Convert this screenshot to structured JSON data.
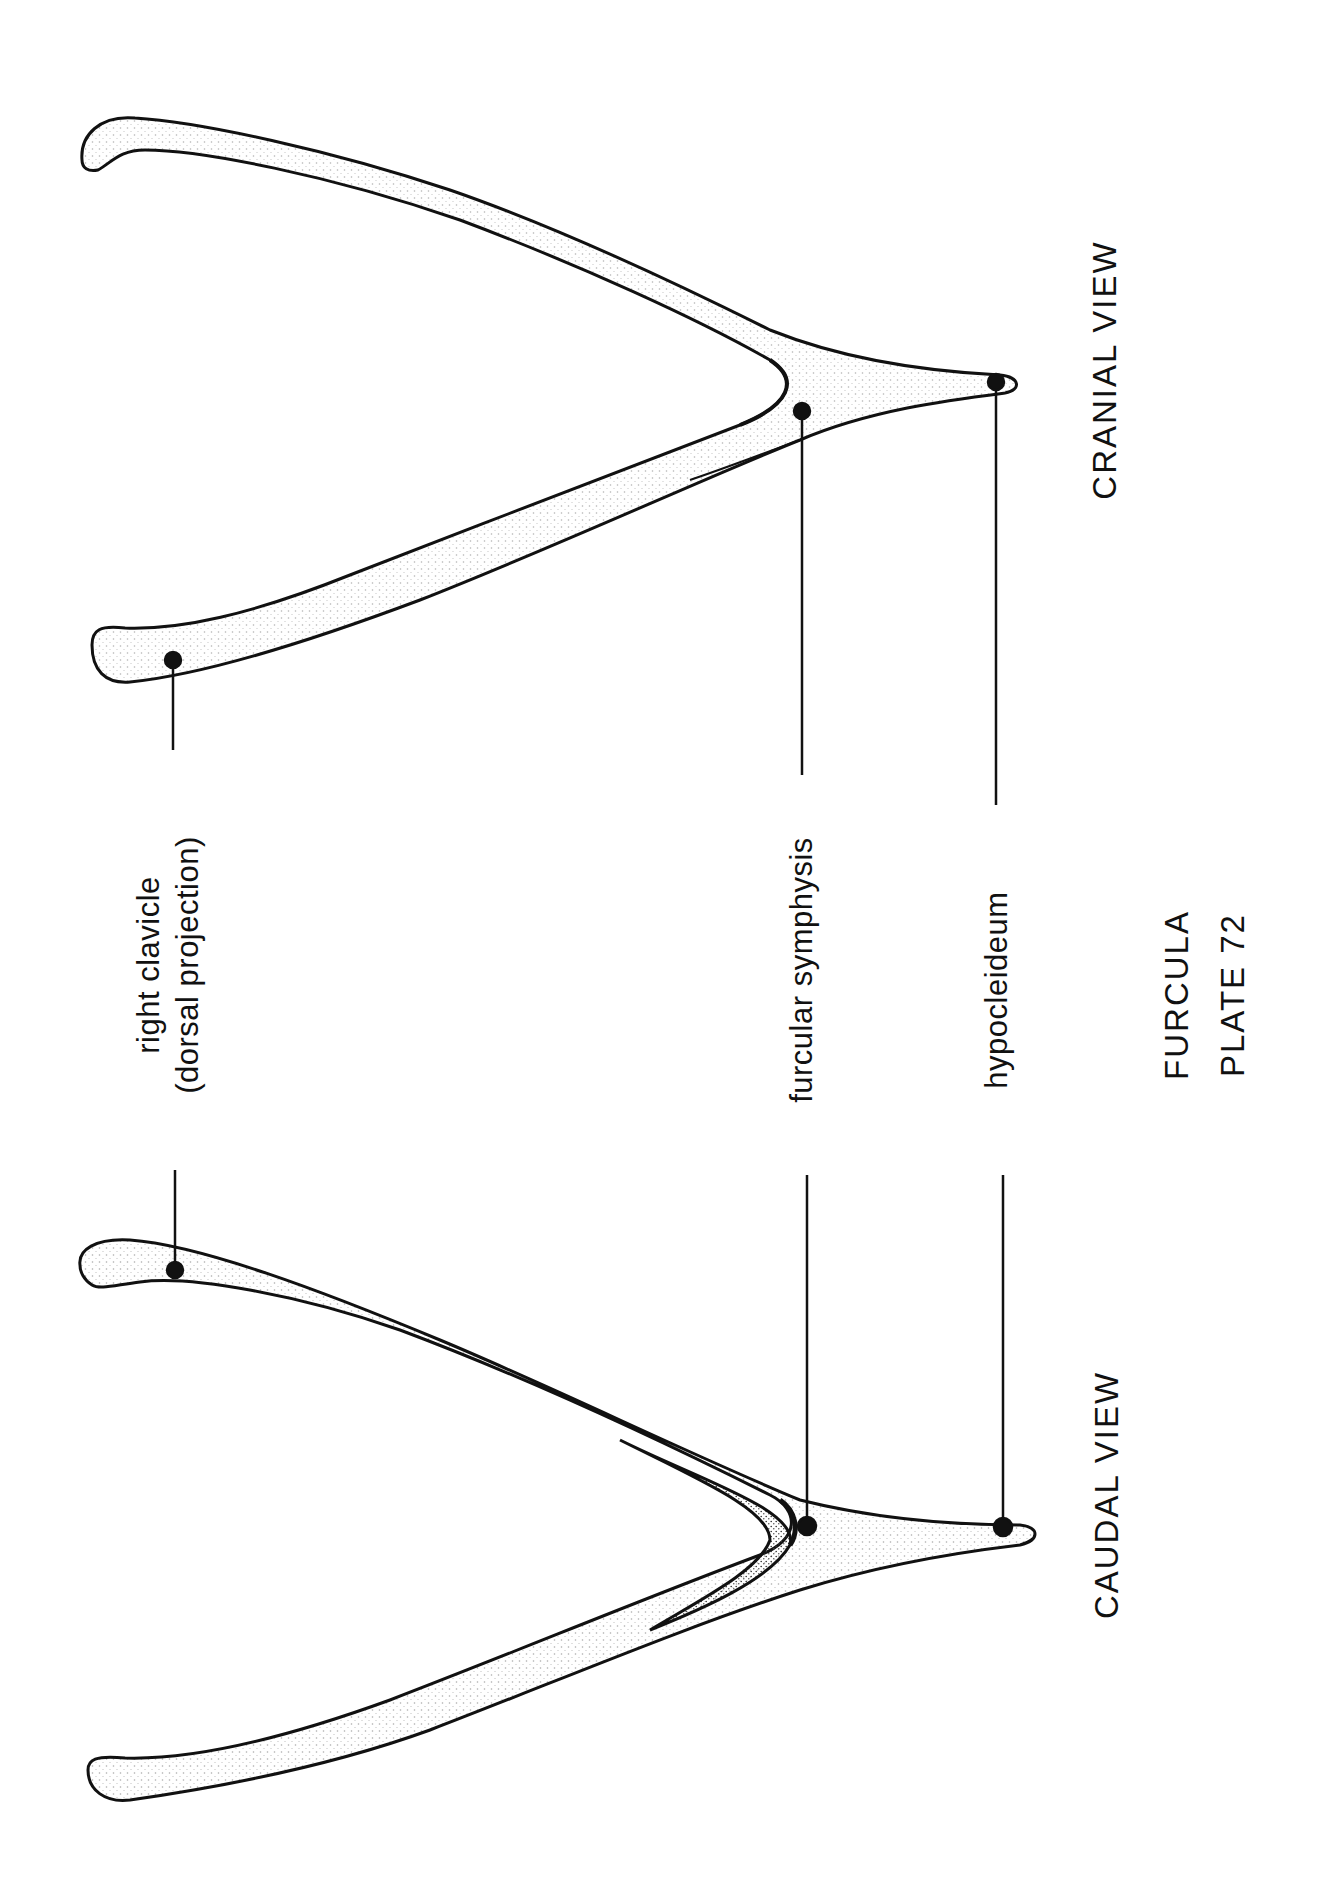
{
  "plate": {
    "title": "FURCULA",
    "plate_number": "PLATE 72"
  },
  "views": {
    "cranial": {
      "label": "CRANIAL VIEW"
    },
    "caudal": {
      "label": "CAUDAL VIEW"
    }
  },
  "annotations": {
    "right_clavicle": {
      "line1": "right clavicle",
      "line2": "(dorsal projection)"
    },
    "furcular_symphysis": "furcular symphysis",
    "hypocleideum": "hypocleideum"
  },
  "colors": {
    "ink": "#111111",
    "paper": "#ffffff",
    "stipple": "#555555"
  }
}
